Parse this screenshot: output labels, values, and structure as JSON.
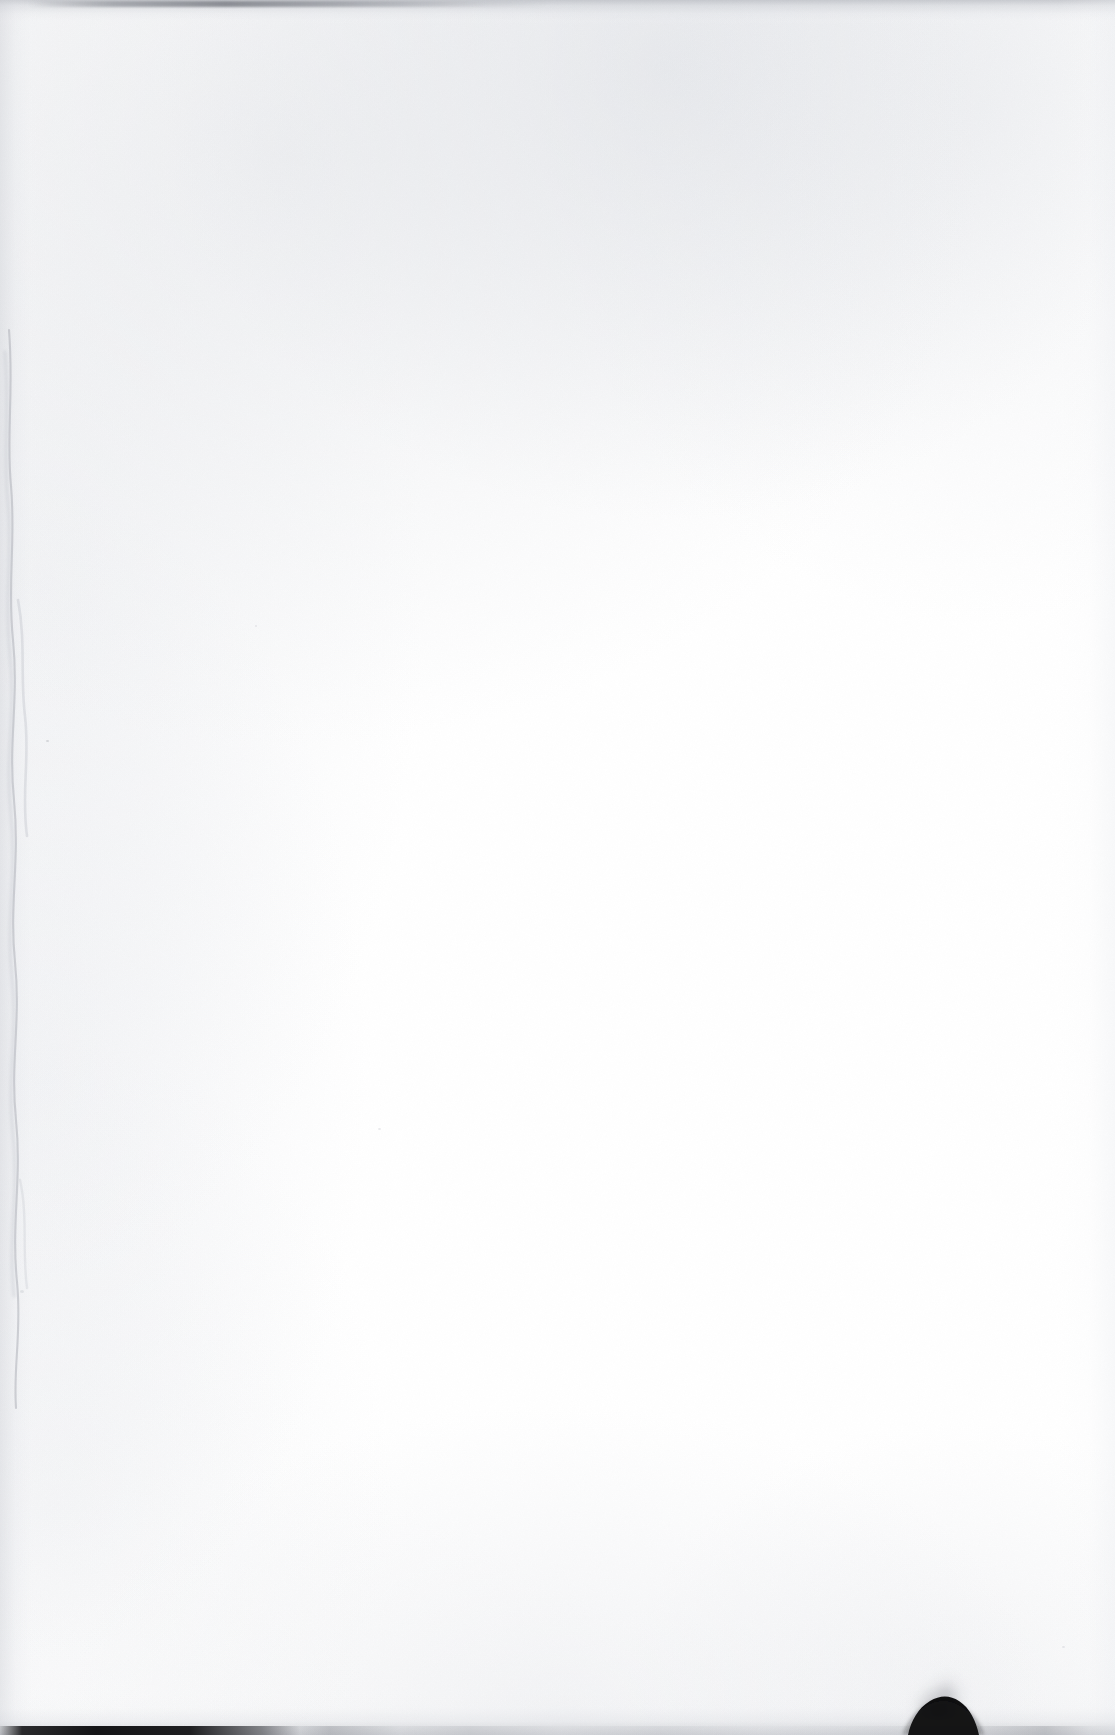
{
  "document": {
    "kind": "scanned-page",
    "content_type": "blank",
    "visible_text": "",
    "page_width": 1115,
    "page_height": 1735,
    "paper_color": "#ffffff",
    "note": "No text, figures, tables or UI elements are rendered on this page."
  },
  "artifacts": {
    "top_edge_shadow": {
      "name": "top-edge-shadow",
      "color": "#b0b3ba",
      "x": 0,
      "y": 0,
      "width": 1115,
      "height": 26
    },
    "top_edge_streak": {
      "name": "top-edge-dark-streak",
      "color": "#6c6f77",
      "x": 28,
      "y": 1,
      "width": 520,
      "height": 6
    },
    "left_gutter_shadow": {
      "name": "left-gutter-shadow",
      "color": "#cdd0d6",
      "x": 0,
      "y": 0,
      "width": 46,
      "height": 1735
    },
    "left_gutter_wave": {
      "name": "left-page-edge-curl",
      "color": "#b9bcc3",
      "x": 2,
      "y": 400,
      "width": 24,
      "height": 900
    },
    "right_edge_falloff": {
      "name": "right-edge-falloff",
      "color": "#eaecf0",
      "x": 1059,
      "y": 0,
      "width": 56,
      "height": 1735
    },
    "bottom_edge_shadow": {
      "name": "bottom-edge-shadow",
      "color": "#aaadb4",
      "x": 0,
      "y": 1695,
      "width": 1115,
      "height": 40
    },
    "bottom_dark_rule": {
      "name": "bottom-dark-rule",
      "color": "#0a0a0c",
      "x": 0,
      "y": 1726,
      "width": 1115,
      "height": 9
    },
    "thumb": {
      "name": "thumb-shadow",
      "color": "#050506",
      "x": 920,
      "y": 1712,
      "width": 62,
      "height": 23
    },
    "thumb_plume": {
      "name": "thumb-blur-plume",
      "color": "#707278",
      "x": 905,
      "y": 1663,
      "width": 70,
      "height": 56
    }
  }
}
